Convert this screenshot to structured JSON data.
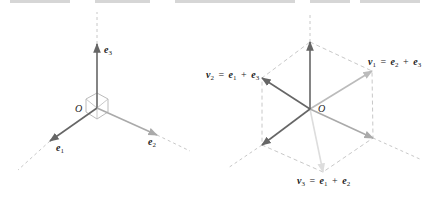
{
  "figure": {
    "left_panel": {
      "origin_label": "O",
      "vectors": [
        {
          "id": "e3",
          "symbol": "e",
          "sub": "3",
          "color": "#666666",
          "from": [
            97,
            108
          ],
          "to": [
            97,
            44
          ]
        },
        {
          "id": "e1",
          "symbol": "e",
          "sub": "1",
          "color": "#666666",
          "from": [
            97,
            108
          ],
          "to": [
            50,
            141
          ]
        },
        {
          "id": "e2",
          "symbol": "e",
          "sub": "2",
          "color": "#aaaaaa",
          "from": [
            97,
            108
          ],
          "to": [
            157,
            135
          ]
        }
      ],
      "labels": {
        "e3": {
          "sym": "e",
          "sub": "3"
        },
        "e1": {
          "sym": "e",
          "sub": "1"
        },
        "e2": {
          "sym": "e",
          "sub": "2"
        }
      }
    },
    "right_panel": {
      "origin_label": "O",
      "vectors": [
        {
          "id": "e3",
          "color": "#666666",
          "from": [
            310,
            109
          ],
          "to": [
            310,
            42
          ]
        },
        {
          "id": "e1",
          "color": "#666666",
          "from": [
            310,
            109
          ],
          "to": [
            262,
            145
          ]
        },
        {
          "id": "e2",
          "color": "#aaaaaa",
          "from": [
            310,
            109
          ],
          "to": [
            373,
            138
          ]
        },
        {
          "id": "v1",
          "color": "#bbbbbb",
          "from": [
            310,
            109
          ],
          "to": [
            372,
            71
          ]
        },
        {
          "id": "v2",
          "color": "#666666",
          "from": [
            310,
            109
          ],
          "to": [
            262,
            78
          ]
        },
        {
          "id": "v3",
          "color": "#dddddd",
          "from": [
            310,
            109
          ],
          "to": [
            323,
            172
          ]
        }
      ],
      "labels": {
        "v1": {
          "lhs": "v",
          "lhs_sub": "1",
          "eq": "=",
          "a": "e",
          "a_sub": "2",
          "plus": "+",
          "b": "e",
          "b_sub": "3"
        },
        "v2": {
          "lhs": "v",
          "lhs_sub": "2",
          "eq": "=",
          "a": "e",
          "a_sub": "1",
          "plus": "+",
          "b": "e",
          "b_sub": "3"
        },
        "v3": {
          "lhs": "v",
          "lhs_sub": "3",
          "eq": "=",
          "a": "e",
          "a_sub": "1",
          "plus": "+",
          "b": "e",
          "b_sub": "2"
        }
      }
    },
    "colors": {
      "dark_vector": "#666666",
      "mid_vector": "#aaaaaa",
      "light_vector": "#dddddd",
      "dashed_guide": "#c8c8c8",
      "cube_edge": "#aaaaaa"
    }
  }
}
